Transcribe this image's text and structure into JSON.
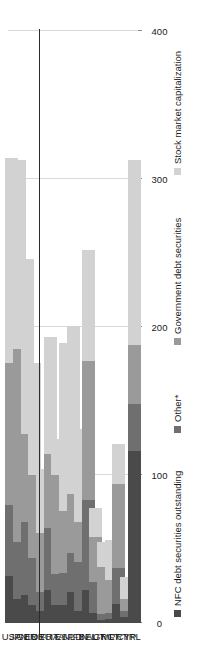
{
  "chart_data": {
    "type": "bar",
    "orientation": "horizontal-stacked",
    "title": "",
    "subtitle": "",
    "xlabel": "",
    "ylabel": "",
    "xlim": [
      0,
      400
    ],
    "xticks": [
      0,
      100,
      200,
      300,
      400
    ],
    "xtick_labels": [
      "0",
      "100",
      "200",
      "300",
      "400"
    ],
    "grid": true,
    "legend_position": "bottom",
    "categories": [
      "USA",
      "JPN",
      "GBR",
      "EUR",
      "DEU",
      "FRA",
      "ITA",
      "ESP",
      "NLD",
      "FIN",
      "BEL",
      "AUT",
      "GRC",
      "MLT",
      "PRT",
      "CYP",
      "IRL"
    ],
    "series": [
      {
        "name": "NFC debt securities outstanding",
        "color": "#4a4a4a",
        "values": [
          32,
          16,
          19,
          12,
          8,
          22,
          12,
          12,
          21,
          8,
          22,
          7,
          2,
          3,
          13,
          4,
          116
        ]
      },
      {
        "name": "Other*",
        "color": "#6f6f6f",
        "values": [
          48,
          39,
          49,
          32,
          13,
          42,
          21,
          22,
          26,
          33,
          61,
          21,
          4,
          4,
          24,
          4,
          32
        ]
      },
      {
        "name": "Government debt securities",
        "color": "#9a9a9a",
        "values": [
          96,
          130,
          60,
          56,
          40,
          50,
          67,
          42,
          40,
          27,
          94,
          30,
          32,
          22,
          57,
          8,
          40
        ]
      },
      {
        "name": "Stock market capitalization",
        "color": "#d2d2d2",
        "values": [
          138,
          128,
          118,
          76,
          43,
          79,
          24,
          113,
          114,
          63,
          75,
          20,
          17,
          27,
          27,
          15,
          125
        ]
      }
    ],
    "annotations": {
      "separator_after_category": "EUR",
      "separator_note": "vertical rule separating aggregates (USA, JPN, GBR, EUR) from individual euro-area countries"
    }
  },
  "legend": {
    "items": [
      {
        "label": "NFC debt securities outstanding",
        "color": "#4a4a4a"
      },
      {
        "label": "Other*",
        "color": "#6f6f6f"
      },
      {
        "label": "Government debt securities",
        "color": "#9a9a9a"
      },
      {
        "label": "Stock market capitalization",
        "color": "#d2d2d2"
      }
    ]
  }
}
